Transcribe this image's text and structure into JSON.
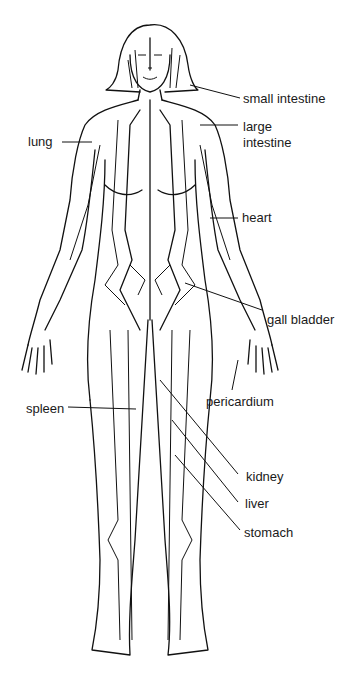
{
  "diagram": {
    "labels": [
      {
        "id": "small_intestine",
        "text": "small intestine"
      },
      {
        "id": "large_intestine_1",
        "text": "large"
      },
      {
        "id": "large_intestine_2",
        "text": "intestine"
      },
      {
        "id": "lung",
        "text": "lung"
      },
      {
        "id": "heart",
        "text": "heart"
      },
      {
        "id": "gall_bladder",
        "text": "gall bladder"
      },
      {
        "id": "pericardium",
        "text": "pericardium"
      },
      {
        "id": "spleen",
        "text": "spleen"
      },
      {
        "id": "kidney",
        "text": "kidney"
      },
      {
        "id": "liver",
        "text": "liver"
      },
      {
        "id": "stomach",
        "text": "stomach"
      }
    ]
  }
}
